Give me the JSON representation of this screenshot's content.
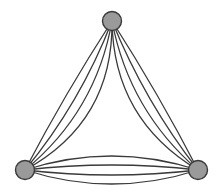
{
  "diagram": {
    "type": "multigraph",
    "colors": {
      "background": "#ffffff",
      "node_fill": "#9a9a9a",
      "node_stroke": "#3a3a3a",
      "edge_stroke": "#3a3a3a"
    },
    "node_radius": 9.5,
    "nodes": [
      {
        "id": "top",
        "x": 112,
        "y": 21
      },
      {
        "id": "bottom-left",
        "x": 25,
        "y": 170
      },
      {
        "id": "bottom-right",
        "x": 198,
        "y": 170
      }
    ],
    "edge_groups": [
      {
        "from": "top",
        "to": "bottom-left",
        "count": 4,
        "bows": [
          -26,
          -16,
          -7,
          2
        ]
      },
      {
        "from": "top",
        "to": "bottom-right",
        "count": 4,
        "bows": [
          24,
          15,
          6,
          -2
        ]
      },
      {
        "from": "bottom-left",
        "to": "bottom-right",
        "count": 4,
        "bows": [
          -14,
          -5,
          5,
          14
        ]
      }
    ]
  }
}
